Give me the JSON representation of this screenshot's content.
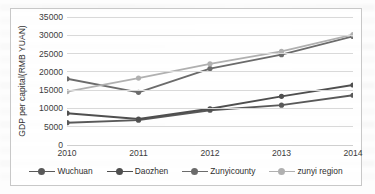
{
  "chart_data": {
    "type": "line",
    "title": "",
    "xlabel": "",
    "ylabel": "GDP per capital(RMB YUAN)",
    "categories": [
      "2010",
      "2011",
      "2012",
      "2013",
      "2014"
    ],
    "ylim": [
      0,
      35000
    ],
    "yticks": [
      35000,
      30000,
      25000,
      20000,
      15000,
      10000,
      5000,
      0
    ],
    "ytick_labels": [
      "35000",
      "30000",
      "25000",
      "20000",
      "15000",
      "10000",
      "5000",
      "0"
    ],
    "grid": true,
    "legend_position": "bottom",
    "series": [
      {
        "name": "Wuchuan",
        "color": "#595959",
        "values": [
          6100,
          6800,
          9500,
          10900,
          13600
        ]
      },
      {
        "name": "Daozhen",
        "color": "#4f4f4f",
        "values": [
          8700,
          7100,
          9900,
          13300,
          16400
        ]
      },
      {
        "name": "Zunyicounty",
        "color": "#6b6b6b",
        "values": [
          18100,
          14400,
          20900,
          24700,
          29700
        ]
      },
      {
        "name": "zunyi region",
        "color": "#b0b0b0",
        "values": [
          14600,
          18300,
          22200,
          25600,
          30200
        ]
      }
    ]
  },
  "chart": {
    "frame_border_color": "#c8c8c8",
    "gridline_color": "#d9d9d9",
    "background": "#ffffff"
  }
}
